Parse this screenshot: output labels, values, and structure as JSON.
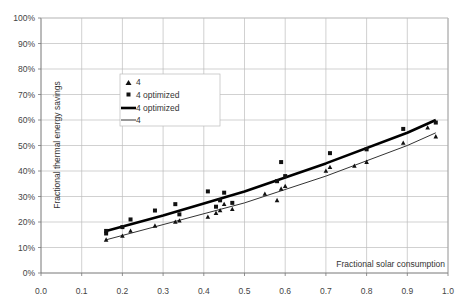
{
  "chart_data": {
    "type": "scatter",
    "title": "",
    "xlabel": "Fractional solar consumption",
    "ylabel": "Fractional thermal energy savings",
    "xlim": [
      0.0,
      1.0
    ],
    "ylim": [
      0,
      100
    ],
    "x_ticks": [
      "0.0",
      "0.1",
      "0.2",
      "0.3",
      "0.4",
      "0.5",
      "0.6",
      "0.7",
      "0.8",
      "0.9",
      "1.0"
    ],
    "y_ticks": [
      "0%",
      "10%",
      "20%",
      "30%",
      "40%",
      "50%",
      "60%",
      "70%",
      "80%",
      "90%",
      "100%"
    ],
    "grid": true,
    "legend_position": "upper-left-inside",
    "legend": [
      "4",
      "4 optimized",
      "4 optimized",
      "4"
    ],
    "series": [
      {
        "name": "4",
        "kind": "markers",
        "marker": "triangle",
        "points": [
          [
            0.16,
            13
          ],
          [
            0.2,
            14.5
          ],
          [
            0.22,
            16.5
          ],
          [
            0.28,
            18.5
          ],
          [
            0.33,
            20
          ],
          [
            0.34,
            20.5
          ],
          [
            0.41,
            22
          ],
          [
            0.43,
            23.5
          ],
          [
            0.44,
            24.5
          ],
          [
            0.45,
            27
          ],
          [
            0.47,
            25
          ],
          [
            0.55,
            31
          ],
          [
            0.58,
            28.5
          ],
          [
            0.59,
            33
          ],
          [
            0.6,
            34
          ],
          [
            0.7,
            40
          ],
          [
            0.71,
            41.5
          ],
          [
            0.77,
            42
          ],
          [
            0.8,
            43.5
          ],
          [
            0.89,
            51
          ],
          [
            0.95,
            57
          ],
          [
            0.97,
            53.5
          ]
        ]
      },
      {
        "name": "4 optimized",
        "kind": "markers",
        "marker": "square",
        "points": [
          [
            0.16,
            15.5
          ],
          [
            0.16,
            16.5
          ],
          [
            0.2,
            18
          ],
          [
            0.22,
            21
          ],
          [
            0.28,
            24.5
          ],
          [
            0.33,
            27
          ],
          [
            0.34,
            23
          ],
          [
            0.41,
            32
          ],
          [
            0.43,
            26
          ],
          [
            0.44,
            28.5
          ],
          [
            0.45,
            31.5
          ],
          [
            0.47,
            27.5
          ],
          [
            0.58,
            36
          ],
          [
            0.59,
            43.5
          ],
          [
            0.6,
            38
          ],
          [
            0.71,
            47
          ],
          [
            0.8,
            48.5
          ],
          [
            0.89,
            56.5
          ],
          [
            0.97,
            59
          ]
        ]
      },
      {
        "name": "4 optimized",
        "kind": "line",
        "width": "thick",
        "points": [
          [
            0.16,
            16.5
          ],
          [
            0.3,
            22.5
          ],
          [
            0.5,
            32
          ],
          [
            0.7,
            43
          ],
          [
            0.9,
            55
          ],
          [
            0.97,
            60
          ]
        ]
      },
      {
        "name": "4",
        "kind": "line",
        "width": "thin",
        "points": [
          [
            0.16,
            13
          ],
          [
            0.3,
            19
          ],
          [
            0.5,
            27.5
          ],
          [
            0.7,
            38
          ],
          [
            0.9,
            50
          ],
          [
            0.97,
            55
          ]
        ]
      }
    ]
  }
}
